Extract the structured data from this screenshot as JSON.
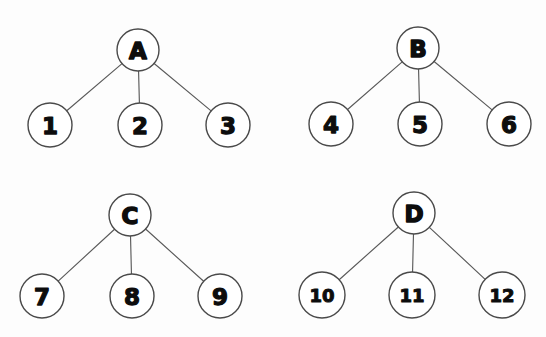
{
  "page": {
    "background_color": "#fdfdfd",
    "node_fill": "#ffffff",
    "node_stroke": "#4a4a4a",
    "edge_stroke": "#5a5a5a",
    "label_color": "#0d0d0d",
    "width": 546,
    "height": 337
  },
  "trees": [
    {
      "id": "tree-a",
      "root": {
        "label": "A",
        "cx": 138,
        "cy": 50,
        "r": 21
      },
      "children": [
        {
          "label": "1",
          "cx": 50,
          "cy": 125,
          "r": 22
        },
        {
          "label": "2",
          "cx": 140,
          "cy": 125,
          "r": 22
        },
        {
          "label": "3",
          "cx": 228,
          "cy": 125,
          "r": 22
        }
      ]
    },
    {
      "id": "tree-b",
      "root": {
        "label": "B",
        "cx": 418,
        "cy": 48,
        "r": 21
      },
      "children": [
        {
          "label": "4",
          "cx": 331,
          "cy": 124,
          "r": 22
        },
        {
          "label": "5",
          "cx": 420,
          "cy": 124,
          "r": 22
        },
        {
          "label": "6",
          "cx": 509,
          "cy": 124,
          "r": 22
        }
      ]
    },
    {
      "id": "tree-c",
      "root": {
        "label": "C",
        "cx": 130,
        "cy": 215,
        "r": 21
      },
      "children": [
        {
          "label": "7",
          "cx": 42,
          "cy": 296,
          "r": 22
        },
        {
          "label": "8",
          "cx": 132,
          "cy": 296,
          "r": 22
        },
        {
          "label": "9",
          "cx": 220,
          "cy": 296,
          "r": 22
        }
      ]
    },
    {
      "id": "tree-d",
      "root": {
        "label": "D",
        "cx": 414,
        "cy": 213,
        "r": 21
      },
      "children": [
        {
          "label": "10",
          "cx": 322,
          "cy": 295,
          "r": 23
        },
        {
          "label": "11",
          "cx": 412,
          "cy": 295,
          "r": 23
        },
        {
          "label": "12",
          "cx": 502,
          "cy": 295,
          "r": 23
        }
      ]
    }
  ]
}
